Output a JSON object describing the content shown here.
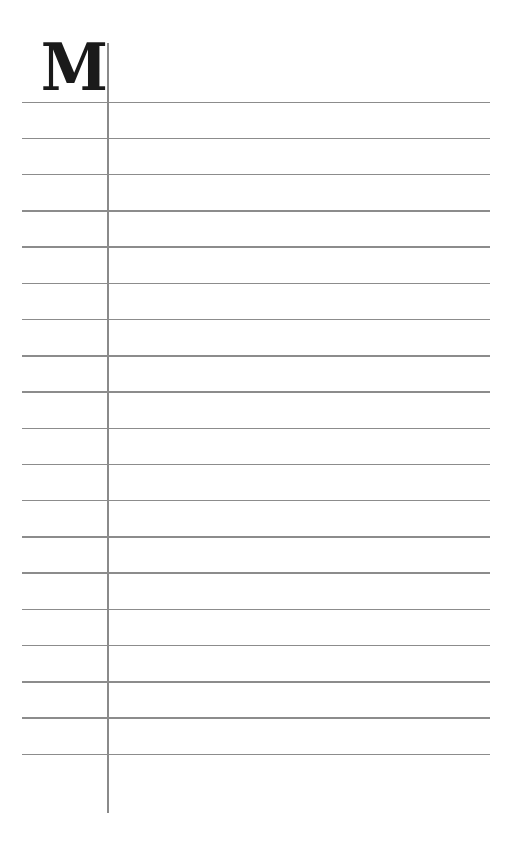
{
  "page": {
    "initial": "M",
    "rule_count": 19,
    "colors": {
      "ink": "#1a1a1a",
      "rule": "#8c8c8c",
      "paper": "#ffffff"
    }
  }
}
